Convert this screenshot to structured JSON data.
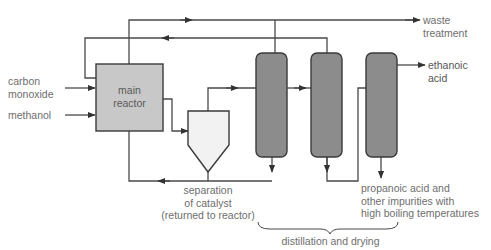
{
  "diagram": {
    "colors": {
      "line": "#4a4a4a",
      "reactor_fill": "#c8c8c8",
      "separator_fill": "#f2f2f2",
      "column_fill": "#8c8c8c",
      "text": "#6e6e6e"
    },
    "inputs": {
      "carbon_monoxide": [
        "carbon",
        "monoxide"
      ],
      "methanol": "methanol"
    },
    "reactor": {
      "label_line1": "main",
      "label_line2": "reactor"
    },
    "separator": {
      "label_line1": "separation",
      "label_line2": "of catalyst",
      "label_line3": "(returned to reactor)"
    },
    "outputs": {
      "waste": {
        "line1": "waste",
        "line2": "treatment"
      },
      "product": {
        "line1": "ethanoic",
        "line2": "acid"
      },
      "impurities": {
        "line1": "propanoic acid and",
        "line2": "other impurities with",
        "line3": "high boiling temperatures"
      }
    },
    "columns_group_label": "distillation and drying",
    "columns": [
      {
        "id": "column-1"
      },
      {
        "id": "column-2"
      },
      {
        "id": "column-3"
      }
    ]
  }
}
